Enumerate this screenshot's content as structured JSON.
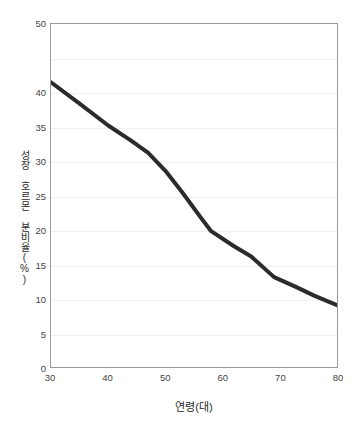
{
  "chart_data": {
    "type": "line",
    "title": "",
    "subtitle": "",
    "xlabel": "연령(대)",
    "ylabel": "성장 호르몬 분비율(%)",
    "xlim": [
      30,
      80
    ],
    "ylim": [
      0,
      50
    ],
    "xticks": [
      30,
      40,
      50,
      60,
      70,
      80
    ],
    "xtick_labels": [
      "30",
      "40",
      "50",
      "60",
      "70",
      "80"
    ],
    "yticks": [
      0,
      5,
      10,
      15,
      20,
      25,
      30,
      35,
      40,
      45,
      50
    ],
    "ytick_labels": [
      "0",
      "5",
      "10",
      "15",
      "20",
      "25",
      "30",
      "35",
      "40",
      "",
      "50"
    ],
    "grid": true,
    "grid_axis": "y",
    "legend": false,
    "legend_position": "none",
    "series": [
      {
        "name": "성장 호르몬 분비율(%)",
        "color": "#2b2b2b",
        "line_width": 4,
        "x": [
          30,
          35,
          40,
          44,
          47,
          50,
          53,
          56,
          58,
          62,
          65,
          69,
          73,
          76,
          80
        ],
        "values": [
          41.5,
          38.4,
          35.2,
          33.0,
          31.2,
          28.6,
          25.4,
          22.0,
          19.8,
          17.6,
          16.1,
          13.1,
          11.6,
          10.4,
          9.0
        ]
      }
    ],
    "annotations": []
  },
  "axis": {
    "y_title": "성장 호르몬 분비율(%)",
    "x_title": "연령(대)"
  }
}
